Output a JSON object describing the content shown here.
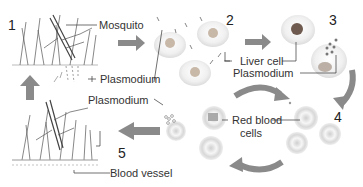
{
  "diagram": {
    "steps": [
      {
        "number": "1",
        "description": "Mosquito bite injects Plasmodium"
      },
      {
        "number": "2",
        "description": "Plasmodium infects liver cells"
      },
      {
        "number": "3",
        "description": "Plasmodium released from liver cell"
      },
      {
        "number": "4",
        "description": "Plasmodium infects red blood cells"
      },
      {
        "number": "5",
        "description": "Mosquito takes up Plasmodium from blood"
      }
    ],
    "labels": {
      "mosquito": "Mosquito",
      "plasmodium_1": "Plasmodium",
      "liver_cell": "Liver cell",
      "plasmodium_3": "Plasmodium",
      "red_blood_cells_line1": "Red blood",
      "red_blood_cells_line2": "cells",
      "plasmodium_5": "Plasmodium",
      "blood_vessel": "Blood vessel"
    },
    "colors": {
      "arrow": "#8a8a8a",
      "cell": "#e6e6e6",
      "text": "#333333"
    }
  }
}
